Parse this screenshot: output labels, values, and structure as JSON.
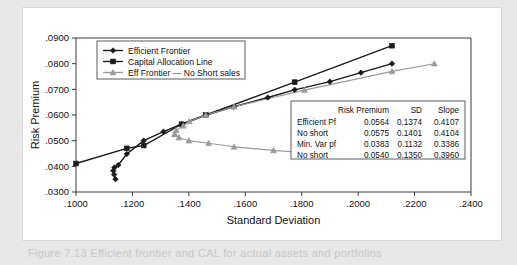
{
  "caption": "Figure 7.13  Efficient frontier and CAL for actual assets and portfolios",
  "colors": {
    "page_background": "#e7e7e7",
    "card_background": "#ffffff",
    "frontier": "#1a1a1a",
    "cal": "#1a1a1a",
    "no_short": "#9a9a9a",
    "axis": "#3a3a3a",
    "frame": "#5a5a5a"
  },
  "chart_data": {
    "type": "line",
    "title": "",
    "xlabel": "Standard Deviation",
    "ylabel": "Risk Premium",
    "xlim": [
      0.1,
      0.24
    ],
    "ylim": [
      0.03,
      0.09
    ],
    "xticks": [
      ".1000",
      ".1200",
      ".1400",
      ".1600",
      ".1800",
      ".2000",
      ".2200",
      ".2400"
    ],
    "xtick_values": [
      0.1,
      0.12,
      0.14,
      0.16,
      0.18,
      0.2,
      0.22,
      0.24
    ],
    "yticks": [
      ".0300",
      ".0400",
      ".0500",
      ".0600",
      ".0700",
      ".0800",
      ".0900"
    ],
    "ytick_values": [
      0.03,
      0.04,
      0.05,
      0.06,
      0.07,
      0.08,
      0.09
    ],
    "grid": false,
    "legend_position": "top-left",
    "series": [
      {
        "name": "Efficient Frontier",
        "color": "#1a1a1a",
        "marker": "diamond",
        "x": [
          0.114,
          0.1135,
          0.1132,
          0.1136,
          0.115,
          0.118,
          0.124,
          0.131,
          0.1374,
          0.146,
          0.156,
          0.168,
          0.1775,
          0.19,
          0.201,
          0.212
        ],
        "y": [
          0.035,
          0.0368,
          0.0383,
          0.0395,
          0.0405,
          0.0448,
          0.05,
          0.0535,
          0.0564,
          0.06,
          0.0632,
          0.0668,
          0.0698,
          0.073,
          0.0765,
          0.08
        ]
      },
      {
        "name": "Capital Allocation Line",
        "color": "#1a1a1a",
        "marker": "square",
        "x": [
          0.1,
          0.118,
          0.124,
          0.1374,
          0.146,
          0.1775,
          0.212
        ],
        "y": [
          0.0411,
          0.047,
          0.0481,
          0.0564,
          0.06,
          0.0728,
          0.087
        ]
      },
      {
        "name": "Eff Frontier — No Short sales",
        "color": "#9a9a9a",
        "marker": "triangle",
        "x": [
          0.135,
          0.1355,
          0.138,
          0.1401,
          0.146,
          0.156,
          0.181,
          0.212,
          0.227
        ],
        "y": [
          0.0525,
          0.054,
          0.0558,
          0.0575,
          0.06,
          0.0632,
          0.0697,
          0.077,
          0.08
        ]
      },
      {
        "name": "Eff Frontier — No Short sales (lower branch)",
        "color": "#9a9a9a",
        "marker": "triangle",
        "x": [
          0.135,
          0.1365,
          0.14,
          0.147,
          0.156,
          0.17,
          0.188
        ],
        "y": [
          0.0525,
          0.0512,
          0.05,
          0.049,
          0.0476,
          0.0462,
          0.0448
        ]
      }
    ],
    "legend": [
      {
        "label": "Efficient Frontier",
        "color": "#1a1a1a",
        "marker": "diamond"
      },
      {
        "label": "Capital Allocation Line",
        "color": "#1a1a1a",
        "marker": "square"
      },
      {
        "label": "Eff Frontier — No Short sales",
        "color": "#9a9a9a",
        "marker": "triangle"
      }
    ],
    "table": {
      "headers": [
        "",
        "Risk Premium",
        "SD",
        "Slope"
      ],
      "rows": [
        [
          "Efficient Pf",
          "0.0564",
          "0.1374",
          "0.4107"
        ],
        [
          "No short",
          "0.0575",
          "0.1401",
          "0.4104"
        ],
        [
          "Min. Var pf",
          "0.0383",
          "0.1132",
          "0.3386"
        ],
        [
          "No short",
          "0.0540",
          "0.1350",
          "0.3960"
        ]
      ]
    }
  }
}
